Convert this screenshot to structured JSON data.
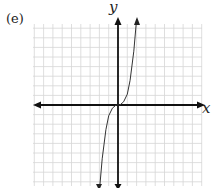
{
  "figure": {
    "panel_label": "(e)",
    "x_axis_label": "x",
    "y_axis_label": "y"
  },
  "chart_data": {
    "type": "line",
    "title": "",
    "panel_label": "(e)",
    "xlabel": "x",
    "ylabel": "y",
    "grid": true,
    "tick_labels": "none",
    "xlim": [
      -9,
      9
    ],
    "ylim": [
      -8,
      8
    ],
    "series": [
      {
        "name": "f(x)",
        "x": [
          -2.0,
          -1.7,
          -1.3,
          -1.0,
          -0.6,
          -0.2,
          0,
          0.2,
          0.6,
          1.0,
          1.3,
          1.7,
          2.0
        ],
        "y": [
          -8.0,
          -5.0,
          -2.3,
          -1.0,
          -0.3,
          0.0,
          0,
          0.0,
          0.3,
          1.0,
          2.3,
          5.0,
          8.0
        ]
      }
    ],
    "colors": {
      "grid": "#d4d4d4",
      "axes": "#111111",
      "curve": "#333333"
    }
  }
}
